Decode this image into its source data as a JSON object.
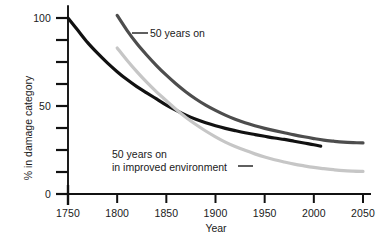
{
  "chart_data": {
    "type": "line",
    "title": "",
    "subtitle": "",
    "xlabel": "Year",
    "ylabel": "% in damage category",
    "xlim": [
      1730,
      2065
    ],
    "ylim": [
      0,
      105
    ],
    "grid": false,
    "legend_position": "inline-annotations",
    "x_ticks": [
      1750,
      1800,
      1850,
      1900,
      1950,
      2000,
      2050
    ],
    "x_tick_labels": [
      "1750",
      "1800",
      "1850",
      "1900",
      "1950",
      "2000",
      "2050"
    ],
    "y_ticks": [
      0,
      50,
      100
    ],
    "y_tick_labels": [
      "0",
      "50",
      "100"
    ],
    "y_minor_ticks": [
      12.5,
      25,
      37.5,
      62.5,
      75,
      87.5
    ],
    "series": [
      {
        "name": "baseline",
        "label": "",
        "color": "#111111",
        "width": 3.2,
        "x": [
          1750,
          1760,
          1770,
          1780,
          1790,
          1800,
          1810,
          1820,
          1830,
          1840,
          1850,
          1860,
          1870,
          1880,
          1890,
          1900,
          1910,
          1920,
          1930,
          1940,
          1950,
          1960,
          1970,
          1980,
          1990,
          2000,
          2007
        ],
        "y": [
          100,
          93,
          86,
          80,
          74.5,
          69.5,
          65,
          61,
          57.5,
          54,
          50.5,
          47.5,
          44.8,
          42.5,
          40.5,
          38.8,
          37.3,
          36,
          34.8,
          33.8,
          32.8,
          31.8,
          31,
          30,
          29,
          28,
          27.2
        ]
      },
      {
        "name": "50 years on",
        "label": "50 years on",
        "color": "#4d4d4d",
        "width": 3.2,
        "x": [
          1800,
          1810,
          1820,
          1830,
          1840,
          1850,
          1860,
          1870,
          1880,
          1890,
          1900,
          1910,
          1920,
          1930,
          1940,
          1950,
          1960,
          1970,
          1980,
          1990,
          2000,
          2010,
          2020,
          2030,
          2040,
          2050
        ],
        "y": [
          101.5,
          93,
          85.5,
          79,
          73,
          67.5,
          62.5,
          58,
          54,
          50.5,
          47.5,
          44.8,
          42.5,
          40.5,
          38.8,
          37.3,
          36,
          34.8,
          33.6,
          32.5,
          31.5,
          30.6,
          30,
          29.5,
          29.2,
          29
        ]
      },
      {
        "name": "50 years on in improved environment",
        "label": "50 years on in improved environment",
        "color": "#c6c6c6",
        "width": 3.2,
        "x": [
          1800,
          1810,
          1820,
          1830,
          1840,
          1850,
          1860,
          1870,
          1880,
          1890,
          1900,
          1910,
          1920,
          1930,
          1940,
          1950,
          1960,
          1970,
          1980,
          1990,
          2000,
          2010,
          2020,
          2030,
          2040,
          2050
        ],
        "y": [
          83,
          76,
          69.5,
          63.5,
          58,
          53,
          48,
          43.5,
          39.5,
          35.8,
          32.5,
          29.5,
          27,
          24.8,
          22.8,
          21,
          19.5,
          18.2,
          17,
          16,
          15.1,
          14.4,
          13.8,
          13.3,
          13,
          12.8
        ]
      }
    ],
    "annotations": [
      {
        "id": "upper",
        "text_lines": [
          "50 years on"
        ],
        "leader_from_x": 132,
        "leader_from_y": 33,
        "leader_to_x": 148,
        "leader_to_y": 33
      },
      {
        "id": "lower",
        "text_lines": [
          "50 years on",
          "in improved environment"
        ],
        "leader_from_x": 238,
        "leader_from_y": 166,
        "leader_to_x": 253,
        "leader_to_y": 166
      }
    ]
  },
  "axes": {
    "x_title": "Year",
    "y_title": "% in damage category",
    "axis_color": "#111111"
  },
  "annotation_text": {
    "upper_line1": "50 years on",
    "lower_line1": "50 years on",
    "lower_line2": "in improved environment"
  },
  "tick_text": {
    "x": [
      "1750",
      "1800",
      "1850",
      "1900",
      "1950",
      "2000",
      "2050"
    ],
    "y": [
      "100",
      "50",
      "0"
    ]
  }
}
